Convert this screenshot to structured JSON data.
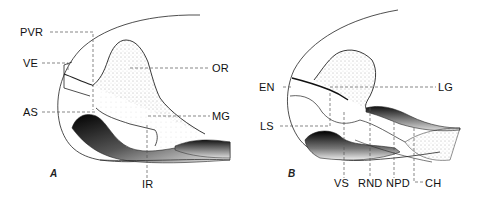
{
  "figure": {
    "panels": [
      {
        "id": "A",
        "letter": "A",
        "labels": {
          "PVR": "PVR",
          "VE": "VE",
          "AS": "AS",
          "OR": "OR",
          "MG": "MG",
          "IR": "IR"
        }
      },
      {
        "id": "B",
        "letter": "B",
        "labels": {
          "EN": "EN",
          "LS": "LS",
          "LG": "LG",
          "VS": "VS",
          "RND": "RND",
          "NPD": "NPD",
          "CH": "CH"
        }
      }
    ],
    "colors": {
      "ink": "#111111",
      "leader": "#555555",
      "background": "#ffffff"
    }
  }
}
